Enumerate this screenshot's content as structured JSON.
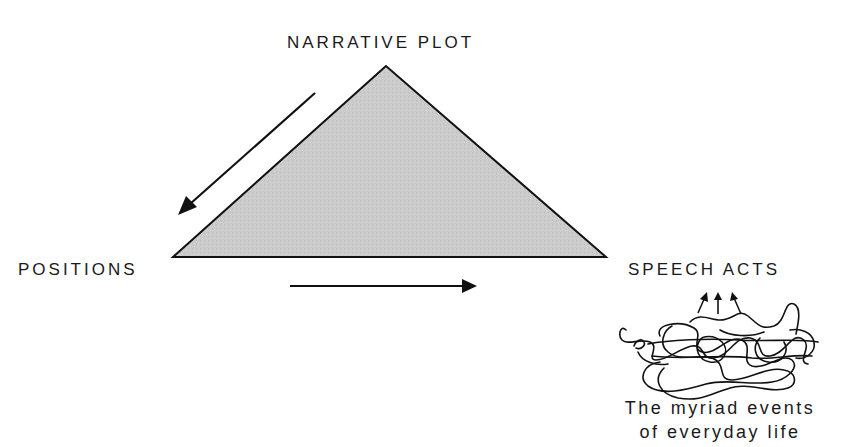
{
  "diagram": {
    "vertices": {
      "top": {
        "label": "NARRATIVE PLOT"
      },
      "left": {
        "label": "POSITIONS"
      },
      "right": {
        "label": "SPEECH ACTS"
      }
    },
    "caption": {
      "line1": "The myriad events",
      "line2": "of everyday life"
    },
    "arrows": [
      {
        "from": "narrative-plot",
        "to": "positions",
        "direction": "down-left"
      },
      {
        "from": "positions",
        "to": "speech-acts",
        "direction": "right"
      },
      {
        "from": "everyday-events",
        "to": "speech-acts",
        "direction": "up",
        "count": 3
      }
    ],
    "colors": {
      "triangle_fill": "#c9c9c9",
      "stroke": "#111111",
      "background": "#ffffff"
    }
  }
}
